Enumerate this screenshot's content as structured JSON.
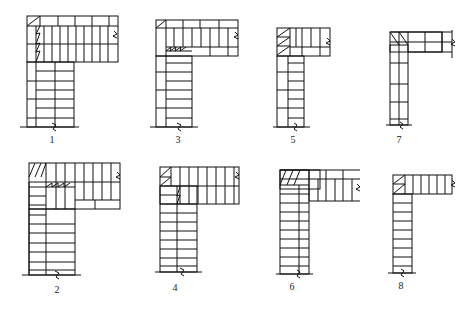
{
  "figure": {
    "labels": [
      "1",
      "2",
      "3",
      "4",
      "5",
      "6",
      "7",
      "8"
    ]
  },
  "diagrams": [
    {
      "id": "1",
      "label": "1",
      "label_x": 52,
      "label_y": 142
    },
    {
      "id": "3",
      "label": "3",
      "label_x": 178,
      "label_y": 142
    },
    {
      "id": "5",
      "label": "5",
      "label_x": 293,
      "label_y": 142
    },
    {
      "id": "7",
      "label": "7",
      "label_x": 399,
      "label_y": 142
    },
    {
      "id": "2",
      "label": "2",
      "label_x": 57,
      "label_y": 292
    },
    {
      "id": "4",
      "label": "4",
      "label_x": 175,
      "label_y": 290
    },
    {
      "id": "6",
      "label": "6",
      "label_x": 292,
      "label_y": 289
    },
    {
      "id": "8",
      "label": "8",
      "label_x": 401,
      "label_y": 288
    }
  ]
}
